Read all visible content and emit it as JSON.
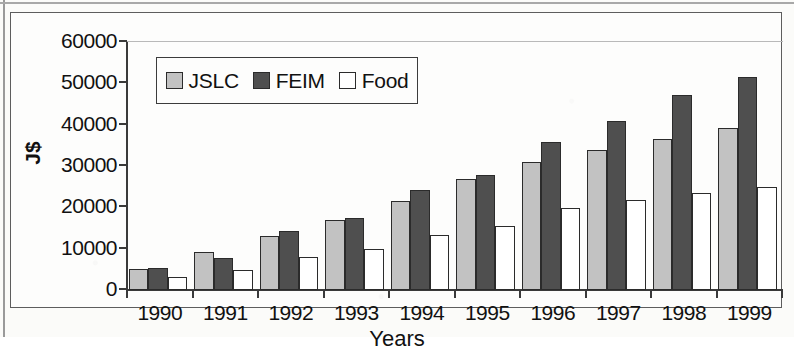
{
  "chart_data": {
    "type": "bar",
    "title": "",
    "xlabel": "Years",
    "ylabel": "J$",
    "categories": [
      "1990",
      "1991",
      "1992",
      "1993",
      "1994",
      "1995",
      "1996",
      "1997",
      "1998",
      "1999"
    ],
    "series": [
      {
        "name": "JSLC",
        "color": "#c2c2c2",
        "values": [
          5200,
          9200,
          13000,
          17000,
          21500,
          26800,
          31000,
          33800,
          36500,
          39300
        ]
      },
      {
        "name": "FEIM",
        "color": "#4f4f4f",
        "values": [
          5400,
          7800,
          14300,
          17500,
          24200,
          27800,
          35800,
          40800,
          47200,
          51500
        ]
      },
      {
        "name": "Food",
        "color": "#ffffff",
        "values": [
          3200,
          4800,
          8000,
          10000,
          13200,
          15500,
          19800,
          21800,
          23500,
          25000
        ]
      }
    ],
    "ylim": [
      0,
      60000
    ],
    "yticks": [
      0,
      10000,
      20000,
      30000,
      40000,
      50000,
      60000
    ],
    "ytick_labels": [
      "0",
      "10000",
      "20000",
      "30000",
      "40000",
      "50000",
      "60000"
    ],
    "grid": false,
    "legend_position": "top-left-inside"
  },
  "axes": {
    "y_axis_title": "J$",
    "x_axis_title": "Years"
  },
  "legend": {
    "entries": [
      {
        "label": "JSLC",
        "swatch": "light-gray-square"
      },
      {
        "label": "FEIM",
        "swatch": "dark-gray-square"
      },
      {
        "label": "Food",
        "swatch": "white-square"
      }
    ]
  }
}
